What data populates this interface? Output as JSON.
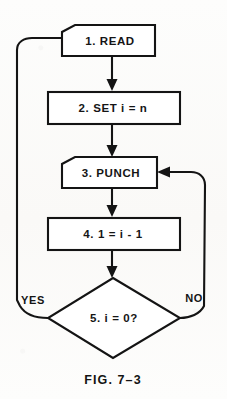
{
  "figure": {
    "caption": "FIG. 7–3",
    "colors": {
      "ink": "#141414",
      "paper": "#fcfcfb",
      "shape_fill": "#ffffff"
    }
  },
  "nodes": [
    {
      "id": "read",
      "shape": "punched-card",
      "label": "1.  READ"
    },
    {
      "id": "set",
      "shape": "rectangle",
      "label": "2.  SET i = n"
    },
    {
      "id": "punch",
      "shape": "punched-card",
      "label": "3.  PUNCH"
    },
    {
      "id": "decrement",
      "shape": "rectangle",
      "label": "4.  1 = i - 1"
    },
    {
      "id": "test",
      "shape": "diamond",
      "label": "5.  i = 0?"
    }
  ],
  "branches": {
    "yes_label": "YES",
    "no_label": "NO"
  },
  "edges": [
    {
      "from": "read",
      "to": "set",
      "kind": "straight-down"
    },
    {
      "from": "set",
      "to": "punch",
      "kind": "straight-down"
    },
    {
      "from": "punch",
      "to": "decrement",
      "kind": "straight-down"
    },
    {
      "from": "decrement",
      "to": "test",
      "kind": "straight-down"
    },
    {
      "from": "test",
      "to": "read",
      "kind": "loop-left",
      "label": "YES"
    },
    {
      "from": "test",
      "to": "punch",
      "kind": "loop-right",
      "label": "NO"
    }
  ]
}
